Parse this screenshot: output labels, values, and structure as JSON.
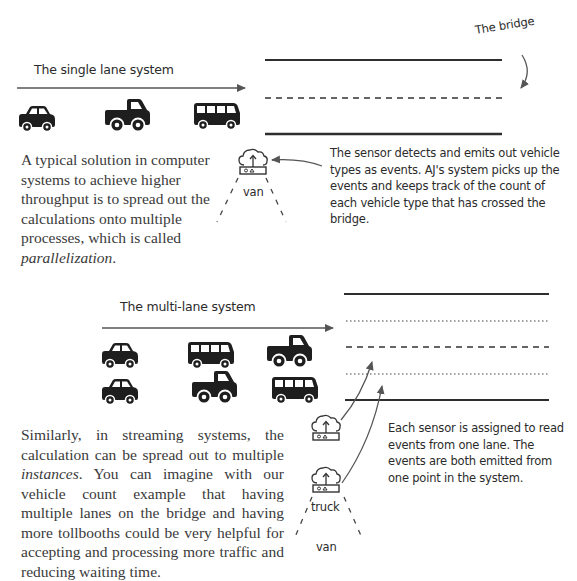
{
  "single_lane": {
    "title": "The single lane system",
    "bridge_label": "The bridge",
    "vehicles": [
      "car",
      "truck",
      "bus"
    ],
    "sensor_label": "van",
    "sensor_note": "The sensor detects and emits out vehicle types as events. AJ's system picks up the events and keeps track of the count of each vehicle type that has crossed the bridge.",
    "description_parts": {
      "before": "A typical solution in computer systems to achieve higher throughput is to spread out the calculations onto multiple processes, which is called ",
      "emphasis": "parallelization",
      "after": "."
    }
  },
  "multi_lane": {
    "title": "The multi-lane system",
    "vehicles_row1": [
      "car",
      "bus",
      "truck"
    ],
    "vehicles_row2": [
      "car",
      "truck",
      "bus"
    ],
    "sensor_labels": [
      "truck",
      "van"
    ],
    "sensor_note": "Each sensor is assigned to read events from one lane. The events are both emitted from one point in the system.",
    "description_parts": {
      "before": "Similarly, in streaming systems, the calculation can be spread out to multiple ",
      "emphasis": "instances",
      "after": ". You can imagine with our vehicle count example that having multiple lanes on the bridge and having more tollbooths could be very helpful for accepting and processing more traffic and reducing waiting time."
    }
  },
  "colors": {
    "ink": "#2b2b2b",
    "line": "#3a3a3a",
    "arrow": "#5a5a5a"
  }
}
